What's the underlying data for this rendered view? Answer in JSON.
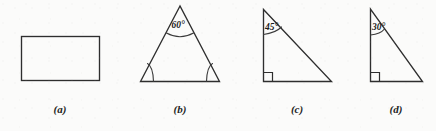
{
  "figure": {
    "background_color": "#fbfbfa",
    "ink_color": "#2e2e2e",
    "panels": [
      {
        "id": "panel-a",
        "caption": "(a)",
        "shape": "rectangle",
        "angle_label": "",
        "has_right_angle_mark": false,
        "arc_marked_angles": 0
      },
      {
        "id": "panel-b",
        "caption": "(b)",
        "shape": "equilateral-triangle",
        "angle_label": "60°",
        "has_right_angle_mark": false,
        "arc_marked_angles": 2
      },
      {
        "id": "panel-c",
        "caption": "(c)",
        "shape": "right-triangle",
        "angle_label": "45°",
        "has_right_angle_mark": true,
        "arc_marked_angles": 1
      },
      {
        "id": "panel-d",
        "caption": "(d)",
        "shape": "right-triangle",
        "angle_label": "30°",
        "has_right_angle_mark": true,
        "arc_marked_angles": 1
      }
    ]
  }
}
